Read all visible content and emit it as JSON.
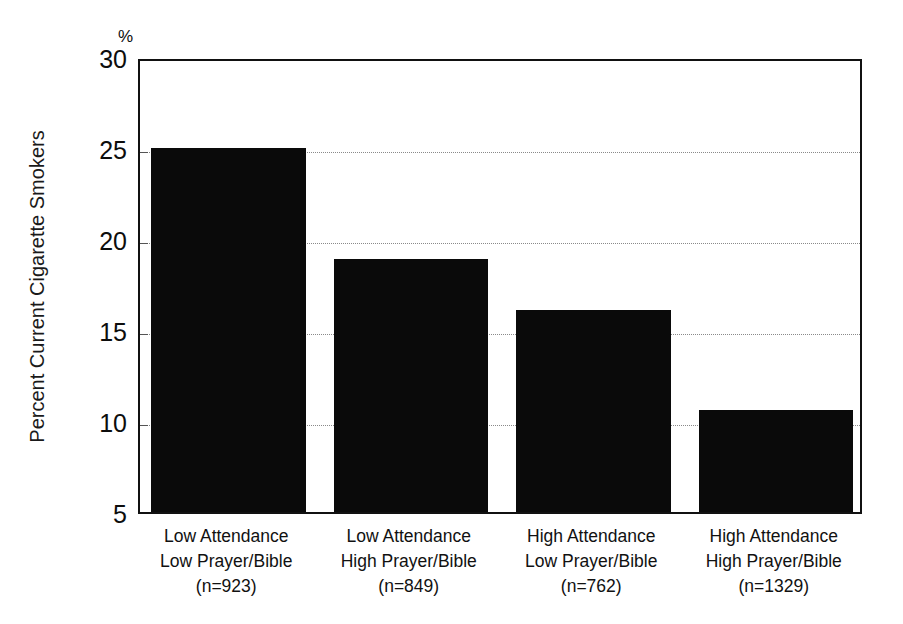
{
  "chart_data": {
    "type": "bar",
    "title": "",
    "subtitle": "",
    "xlabel": "",
    "ylabel": "Percent Current Cigarette Smokers",
    "unit_label": "%",
    "ylim": [
      5,
      30
    ],
    "ytick_labels": [
      "30",
      "25",
      "20",
      "15",
      "10",
      "5"
    ],
    "ytick_values": [
      30,
      25,
      20,
      15,
      10,
      5
    ],
    "gridlines": [
      25,
      20,
      15,
      10
    ],
    "grid": true,
    "legend": null,
    "bar_color": "#0a0a0a",
    "categories": [
      "Low Attendance Low Prayer/Bible (n=923)",
      "Low Attendance High Prayer/Bible (n=849)",
      "High Attendance Low Prayer/Bible (n=762)",
      "High Attendance High Prayer/Bible (n=1329)"
    ],
    "category_lines": [
      [
        "Low Attendance",
        "Low Prayer/Bible",
        "(n=923)"
      ],
      [
        "Low Attendance",
        "High Prayer/Bible",
        "(n=849)"
      ],
      [
        "High Attendance",
        "Low Prayer/Bible",
        "(n=762)"
      ],
      [
        "High Attendance",
        "High Prayer/Bible",
        "(n=1329)"
      ]
    ],
    "sample_sizes": [
      923,
      849,
      762,
      1329
    ],
    "values": [
      25.0,
      18.9,
      16.1,
      10.6
    ]
  }
}
